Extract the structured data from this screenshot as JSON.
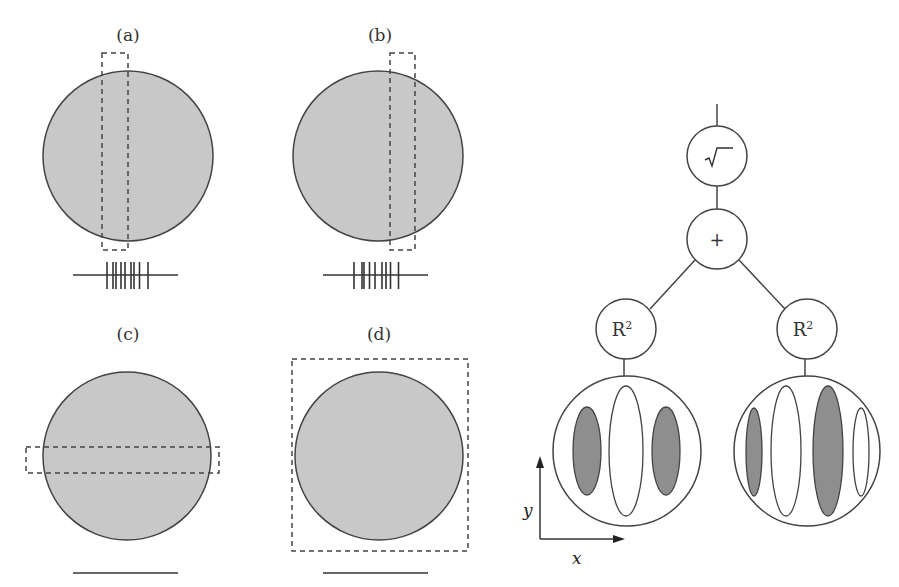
{
  "panels": [
    {
      "id": "a",
      "label": "(a)",
      "window": "vertical-strip-left",
      "output": "spikes",
      "spike_offsets": [
        -0.38,
        -0.26,
        -0.2,
        -0.1,
        -0.02,
        0.1,
        0.16,
        0.27,
        0.44
      ]
    },
    {
      "id": "b",
      "label": "(b)",
      "window": "vertical-strip-right",
      "output": "spikes",
      "spike_offsets": [
        -0.44,
        -0.28,
        -0.24,
        -0.13,
        -0.02,
        0.12,
        0.2,
        0.29,
        0.45
      ]
    },
    {
      "id": "c",
      "label": "(c)",
      "window": "horizontal-strip",
      "output": "flat-line"
    },
    {
      "id": "d",
      "label": "(d)",
      "window": "full-square",
      "output": "flat-line"
    }
  ],
  "tree": {
    "root_symbol": "√‾",
    "sum_symbol": "+",
    "square_nodes": [
      {
        "label": "R",
        "superscript": "2"
      },
      {
        "label": "R",
        "superscript": "2"
      }
    ],
    "receptive_fields": [
      {
        "name": "symmetric",
        "lobes": [
          "dark",
          "light",
          "dark"
        ]
      },
      {
        "name": "asymmetric",
        "lobes": [
          "dark",
          "light",
          "dark",
          "light"
        ]
      }
    ]
  },
  "axes": {
    "x_label": "x",
    "y_label": "y"
  },
  "colors": {
    "disk_fill": "#c8c8c8",
    "dark_lobe": "#8e8e8e",
    "stroke": "#444444",
    "dash": "#444444"
  }
}
